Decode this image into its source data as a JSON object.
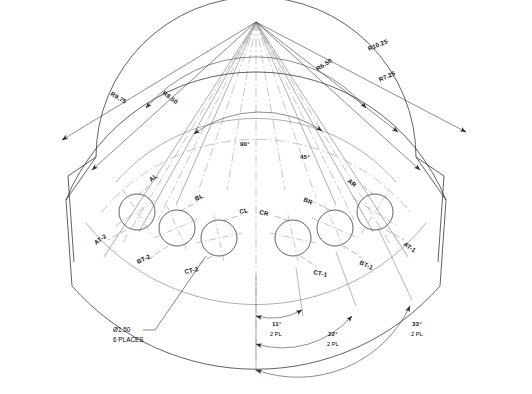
{
  "drawing": {
    "type": "cad-sector-plate",
    "apex": {
      "x": 256,
      "y": 22
    },
    "background_color": "#ffffff",
    "line_color": "#2b2f36",
    "thin_line_color": "#5a6069",
    "center_line_color": "#8a9099",
    "text_color": "#14161a"
  },
  "radii": {
    "items": [
      {
        "name": "R9.75",
        "label": "R9.75",
        "value": 9.75,
        "side": "left"
      },
      {
        "name": "R8.50",
        "label": "R8.50",
        "value": 8.5,
        "side": "left"
      },
      {
        "name": "R6.50",
        "label": "R6.50",
        "value": 6.5,
        "side": "right"
      },
      {
        "name": "R10.25",
        "label": "R10.25",
        "value": 10.25,
        "side": "right"
      },
      {
        "name": "R7.25",
        "label": "R7.25",
        "value": 7.25,
        "side": "right"
      }
    ]
  },
  "angles": {
    "sector": [
      {
        "name": "angle-90",
        "label": "90°",
        "value": 90
      },
      {
        "name": "angle-45",
        "label": "45°",
        "value": 45
      }
    ],
    "dimensions": [
      {
        "name": "angle-11",
        "label": "11°",
        "value": 11,
        "places": "2 PL"
      },
      {
        "name": "angle-22",
        "label": "22°",
        "value": 22,
        "places": "2 PL"
      },
      {
        "name": "angle-33",
        "label": "33°",
        "value": 33,
        "places": "2 PL"
      }
    ]
  },
  "holes": {
    "callout": {
      "diameter": "Ø1.50",
      "quantity": "6 PLACES"
    },
    "upper_labels": [
      {
        "name": "hole-label-al",
        "label": "AL"
      },
      {
        "name": "hole-label-bl",
        "label": "BL"
      },
      {
        "name": "hole-label-cl",
        "label": "CL"
      },
      {
        "name": "hole-label-cr",
        "label": "CR"
      },
      {
        "name": "hole-label-br",
        "label": "BR"
      },
      {
        "name": "hole-label-ar",
        "label": "AR"
      }
    ],
    "lower_labels": [
      {
        "name": "hole-label-at2",
        "label": "AT-2"
      },
      {
        "name": "hole-label-bt2",
        "label": "BT-2"
      },
      {
        "name": "hole-label-ct2",
        "label": "CT-2"
      },
      {
        "name": "hole-label-ct1",
        "label": "CT-1"
      },
      {
        "name": "hole-label-bt1",
        "label": "BT-1"
      },
      {
        "name": "hole-label-at1",
        "label": "AT-1"
      }
    ]
  }
}
